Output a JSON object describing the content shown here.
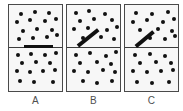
{
  "figure": {
    "background": "#ffffff",
    "panel_fill": "#f7f7f7",
    "panel_border": "#4a4a4a",
    "dot_color": "#111111",
    "bar_color": "#111111",
    "divider_color": "#3c3c3c",
    "label_color": "#4f4f4f",
    "panel_count": 3,
    "panel_geometry": {
      "y": 4,
      "width": 55,
      "height": 88,
      "divider_offset": 42
    },
    "dot_radius": 2.3
  },
  "panels": [
    {
      "id": "A",
      "label": "A",
      "x": 8,
      "bar": {
        "type": "horizontal",
        "x1": 15,
        "y1": 41.5,
        "x2": 44,
        "y2": 41.5,
        "thickness": 3.6
      },
      "top_dots": [
        [
          12,
          9
        ],
        [
          26,
          7
        ],
        [
          40,
          8
        ],
        [
          8,
          17
        ],
        [
          21,
          15
        ],
        [
          36,
          16
        ],
        [
          47,
          14
        ],
        [
          14,
          26
        ],
        [
          28,
          24
        ],
        [
          43,
          25
        ],
        [
          10,
          34
        ],
        [
          24,
          33
        ],
        [
          38,
          32
        ],
        [
          48,
          30
        ]
      ],
      "bottom_dots": [
        [
          9,
          50
        ],
        [
          22,
          49
        ],
        [
          36,
          50
        ],
        [
          47,
          48
        ],
        [
          13,
          58
        ],
        [
          27,
          57
        ],
        [
          41,
          58
        ],
        [
          8,
          66
        ],
        [
          21,
          67
        ],
        [
          34,
          66
        ],
        [
          46,
          65
        ],
        [
          11,
          76
        ],
        [
          25,
          77
        ],
        [
          44,
          77
        ]
      ]
    },
    {
      "id": "B",
      "label": "B",
      "x": 66,
      "bar": {
        "type": "diagonal",
        "x1": 11,
        "y1": 41,
        "x2": 31,
        "y2": 25,
        "thickness": 3.6
      },
      "top_dots": [
        [
          9,
          8
        ],
        [
          22,
          6
        ],
        [
          38,
          9
        ],
        [
          13,
          16
        ],
        [
          27,
          14
        ],
        [
          45,
          15
        ],
        [
          7,
          24
        ],
        [
          21,
          23
        ],
        [
          40,
          25
        ],
        [
          50,
          22
        ],
        [
          16,
          33
        ],
        [
          34,
          32
        ],
        [
          47,
          34
        ]
      ],
      "bottom_dots": [
        [
          9,
          50
        ],
        [
          23,
          48
        ],
        [
          39,
          51
        ],
        [
          49,
          47
        ],
        [
          13,
          58
        ],
        [
          30,
          57
        ],
        [
          44,
          59
        ],
        [
          7,
          66
        ],
        [
          21,
          67
        ],
        [
          36,
          65
        ],
        [
          48,
          67
        ],
        [
          16,
          76
        ],
        [
          30,
          78
        ],
        [
          45,
          76
        ]
      ]
    },
    {
      "id": "C",
      "label": "C",
      "x": 124,
      "bar": {
        "type": "diagonal",
        "x1": 11,
        "y1": 41,
        "x2": 29,
        "y2": 26,
        "thickness": 3.6
      },
      "top_dots": [
        [
          11,
          8
        ],
        [
          27,
          9
        ],
        [
          43,
          7
        ],
        [
          8,
          17
        ],
        [
          22,
          15
        ],
        [
          38,
          17
        ],
        [
          49,
          14
        ],
        [
          15,
          25
        ],
        [
          33,
          24
        ],
        [
          47,
          26
        ],
        [
          25,
          33
        ],
        [
          40,
          34
        ],
        [
          50,
          31
        ]
      ],
      "bottom_dots": [
        [
          10,
          50
        ],
        [
          25,
          49
        ],
        [
          40,
          51
        ],
        [
          15,
          58
        ],
        [
          31,
          57
        ],
        [
          46,
          58
        ],
        [
          8,
          66
        ],
        [
          22,
          67
        ],
        [
          36,
          66
        ],
        [
          48,
          65
        ],
        [
          12,
          77
        ],
        [
          27,
          78
        ],
        [
          44,
          77
        ]
      ]
    }
  ],
  "labels": {
    "a": "A",
    "b": "B",
    "c": "C",
    "y": 95
  }
}
